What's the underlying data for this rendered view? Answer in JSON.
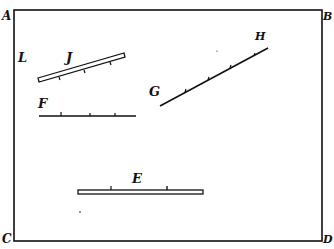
{
  "diagram": {
    "colors": {
      "ink": "#111111",
      "paper": "#ffffff"
    },
    "frame": {
      "corners": {
        "top_left": "A",
        "top_right": "B",
        "bottom_left": "C",
        "bottom_right": "D"
      }
    },
    "labels": {
      "L": "L",
      "J": "J",
      "F": "F",
      "G": "G",
      "H": "H",
      "E": "E"
    },
    "elements": [
      {
        "id": "J",
        "kind": "bar (double-line rod), inclined",
        "ticks": 3
      },
      {
        "id": "F",
        "kind": "horizontal line",
        "ticks": 3
      },
      {
        "id": "GH",
        "kind": "inclined line from G to H",
        "ticks": 4
      },
      {
        "id": "E",
        "kind": "bar (double-line rod), horizontal",
        "ticks": 2
      }
    ]
  }
}
